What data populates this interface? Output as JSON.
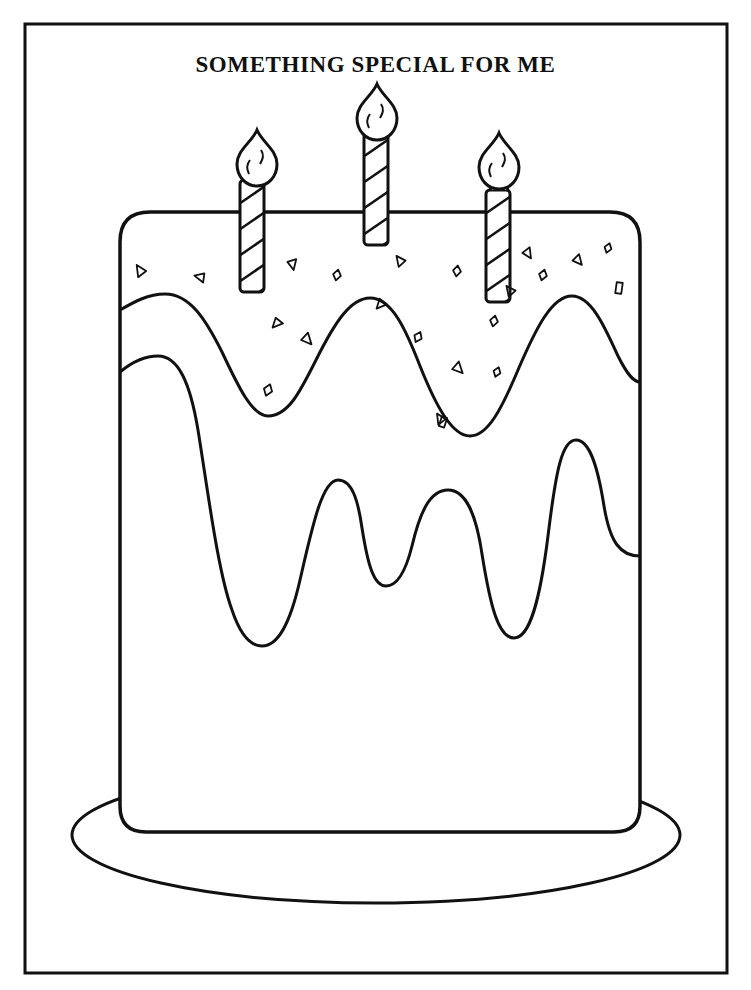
{
  "page": {
    "title": "SOMETHING SPECIAL FOR ME",
    "background_color": "#ffffff",
    "ink_color": "#111111",
    "width": 751,
    "height": 990
  },
  "frame": {
    "name": "page-border",
    "x": 25,
    "y": 24,
    "width": 702,
    "height": 949,
    "stroke_width": 3
  },
  "artwork": {
    "subject": "birthday-cake",
    "style": "coloring-page-line-art",
    "fill": "none",
    "stroke": "#111111"
  },
  "plate": {
    "name": "cake-plate",
    "center_x": 376,
    "center_y": 835,
    "radius_x": 304,
    "radius_y": 68,
    "stroke_width": 3
  },
  "cake_body": {
    "name": "cake-body",
    "x": 120,
    "y": 212,
    "width": 520,
    "height": 620,
    "corner_radius_top": 30,
    "corner_radius_bottom": 26,
    "stroke_width": 3.5
  },
  "frosting_layers": [
    {
      "name": "frosting-layer-upper",
      "stroke_width": 3,
      "left_anchor_y": 310,
      "right_anchor_y": 382,
      "peaks_x": [
        175,
        370,
        570
      ],
      "valleys_x": [
        268,
        470
      ]
    },
    {
      "name": "frosting-layer-lower",
      "stroke_width": 3,
      "left_anchor_y": 372,
      "right_anchor_y": 556,
      "peaks_x": [
        160,
        340,
        455,
        575
      ],
      "valleys_x": [
        245,
        400,
        520
      ]
    }
  ],
  "candles": [
    {
      "name": "candle-left",
      "cx": 252,
      "body_top": 180,
      "body_bottom": 292,
      "body_width": 24,
      "flame_cx": 257,
      "flame_cy": 155,
      "stripes": 5
    },
    {
      "name": "candle-center",
      "cx": 376,
      "body_top": 133,
      "body_bottom": 245,
      "body_width": 24,
      "flame_cx": 377,
      "flame_cy": 109,
      "stripes": 5
    },
    {
      "name": "candle-right",
      "cx": 498,
      "body_top": 190,
      "body_bottom": 302,
      "body_width": 24,
      "flame_cx": 499,
      "flame_cy": 158,
      "stripes": 5
    }
  ],
  "sprinkles": [
    {
      "shape": "triangle",
      "x": 140,
      "y": 272,
      "size": 11,
      "rotation": 200
    },
    {
      "shape": "triangle",
      "x": 201,
      "y": 278,
      "size": 10,
      "rotation": 155
    },
    {
      "shape": "triangle",
      "x": 293,
      "y": 263,
      "size": 10,
      "rotation": 40
    },
    {
      "shape": "diamond",
      "x": 337,
      "y": 275,
      "size": 11,
      "rotation": 12
    },
    {
      "shape": "triangle",
      "x": 307,
      "y": 338,
      "size": 11,
      "rotation": 10
    },
    {
      "shape": "triangle",
      "x": 278,
      "y": 323,
      "size": 10,
      "rotation": 95
    },
    {
      "shape": "diamond",
      "x": 268,
      "y": 390,
      "size": 12,
      "rotation": 20
    },
    {
      "shape": "triangle",
      "x": 400,
      "y": 262,
      "size": 10,
      "rotation": 195
    },
    {
      "shape": "triangle",
      "x": 382,
      "y": 304,
      "size": 10,
      "rotation": 95
    },
    {
      "shape": "diamond",
      "x": 418,
      "y": 337,
      "size": 11,
      "rotation": 25
    },
    {
      "shape": "diamond",
      "x": 457,
      "y": 271,
      "size": 11,
      "rotation": 8
    },
    {
      "shape": "triangle",
      "x": 458,
      "y": 367,
      "size": 11,
      "rotation": 8
    },
    {
      "shape": "triangle",
      "x": 440,
      "y": 420,
      "size": 10,
      "rotation": 200
    },
    {
      "shape": "rect",
      "x": 443,
      "y": 422,
      "size": 10,
      "rotation": 18
    },
    {
      "shape": "diamond",
      "x": 494,
      "y": 321,
      "size": 11,
      "rotation": 12
    },
    {
      "shape": "diamond",
      "x": 497,
      "y": 372,
      "size": 10,
      "rotation": 20
    },
    {
      "shape": "triangle",
      "x": 510,
      "y": 292,
      "size": 10,
      "rotation": 195
    },
    {
      "shape": "triangle",
      "x": 528,
      "y": 252,
      "size": 10,
      "rotation": 20
    },
    {
      "shape": "diamond",
      "x": 543,
      "y": 275,
      "size": 11,
      "rotation": 15
    },
    {
      "shape": "triangle",
      "x": 578,
      "y": 259,
      "size": 10,
      "rotation": 12
    },
    {
      "shape": "diamond",
      "x": 608,
      "y": 248,
      "size": 10,
      "rotation": 18
    },
    {
      "shape": "rect",
      "x": 619,
      "y": 288,
      "size": 11,
      "rotation": 8
    }
  ]
}
